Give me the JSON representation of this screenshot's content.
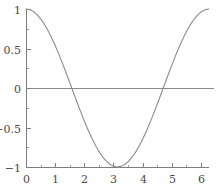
{
  "chart_data": {
    "type": "line",
    "title": "",
    "subtitle": "",
    "xlabel": "",
    "ylabel": "",
    "function": "cos(x)",
    "xlim": [
      0,
      6.283185307179586
    ],
    "ylim": [
      -1,
      1
    ],
    "grid": false,
    "legend": null,
    "legend_position": "none",
    "x_ticks": [
      0,
      1,
      2,
      3,
      4,
      5,
      6
    ],
    "x_tick_labels": [
      "0",
      "1",
      "2",
      "3",
      "4",
      "5",
      "6"
    ],
    "x_minor_ticks": [
      0.5,
      1.5,
      2.5,
      3.5,
      4.5,
      5.5
    ],
    "y_ticks": [
      -1,
      -0.5,
      0,
      0.5,
      1
    ],
    "y_tick_labels": [
      "−1",
      "−0.5",
      "0",
      "0.5",
      "1"
    ],
    "y_minor_ticks": [
      -0.75,
      -0.25,
      0.25,
      0.75
    ],
    "zero_reference_line": 0,
    "series": [
      {
        "name": "cos(x)",
        "color": "#8c8c8c",
        "x": [
          0,
          0.1257,
          0.2513,
          0.377,
          0.5027,
          0.6283,
          0.754,
          0.8796,
          1.0053,
          1.131,
          1.2566,
          1.3823,
          1.508,
          1.6336,
          1.7593,
          1.885,
          2.0106,
          2.1363,
          2.2619,
          2.3876,
          2.5133,
          2.6389,
          2.7646,
          2.8903,
          3.0159,
          3.1416,
          3.2673,
          3.3929,
          3.5186,
          3.6442,
          3.7699,
          3.8956,
          4.0212,
          4.1469,
          4.2726,
          4.3982,
          4.5239,
          4.6496,
          4.7752,
          4.9009,
          5.0265,
          5.1522,
          5.2779,
          5.4035,
          5.5292,
          5.6549,
          5.7805,
          5.9062,
          6.0319,
          6.1575,
          6.2832
        ],
        "y": [
          1.0,
          0.9921,
          0.9686,
          0.9298,
          0.8763,
          0.809,
          0.7289,
          0.6374,
          0.5358,
          0.4258,
          0.309,
          0.1874,
          0.0628,
          -0.0628,
          -0.1874,
          -0.309,
          -0.4258,
          -0.5358,
          -0.6374,
          -0.7289,
          -0.809,
          -0.8763,
          -0.9298,
          -0.9686,
          -0.9921,
          -1.0,
          -0.9921,
          -0.9686,
          -0.9298,
          -0.8763,
          -0.809,
          -0.7289,
          -0.6374,
          -0.5358,
          -0.4258,
          -0.309,
          -0.1874,
          -0.0628,
          0.0628,
          0.1874,
          0.309,
          0.4258,
          0.5358,
          0.6374,
          0.7289,
          0.809,
          0.8763,
          0.9298,
          0.9686,
          0.9921,
          1.0
        ]
      }
    ],
    "annotations": [
      {
        "kind": "maximum",
        "x": 0,
        "y": 1
      },
      {
        "kind": "zero-crossing",
        "x": 1.5708,
        "y": 0
      },
      {
        "kind": "minimum",
        "x": 3.1416,
        "y": -1
      },
      {
        "kind": "zero-crossing",
        "x": 4.7124,
        "y": 0
      },
      {
        "kind": "maximum",
        "x": 6.2832,
        "y": 1
      }
    ]
  },
  "colors": {
    "background": "#ffffff",
    "curve": "#8c8c8c",
    "axis": "#7d7d7d",
    "zero_line": "#8a8a8a",
    "tick_label": "#4a4a4a"
  },
  "geometry": {
    "plot_left": 26,
    "plot_right": 209,
    "plot_top": 9,
    "plot_bottom": 167
  }
}
